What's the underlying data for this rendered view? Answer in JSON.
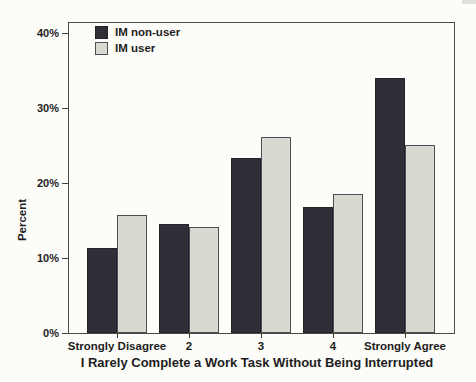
{
  "chart_data": {
    "type": "bar",
    "title": "",
    "categories": [
      "Strongly Disagree",
      "2",
      "3",
      "4",
      "Strongly Agree"
    ],
    "series": [
      {
        "name": "IM non-user",
        "color": "#2f2f38",
        "border_color": "#22222a",
        "values": [
          11.3,
          14.6,
          23.4,
          16.8,
          34.0
        ]
      },
      {
        "name": "IM user",
        "color": "#d9d9d1",
        "border_color": "#4d4d55",
        "values": [
          15.8,
          14.1,
          26.2,
          18.5,
          25.1
        ]
      }
    ],
    "xlabel": "I Rarely Complete a Work Task Without Being Interrupted",
    "ylabel": "Percent",
    "y_ticks": [
      {
        "label": "0%",
        "value": 0
      },
      {
        "label": "10%",
        "value": 10
      },
      {
        "label": "20%",
        "value": 20
      },
      {
        "label": "30%",
        "value": 30
      },
      {
        "label": "40%",
        "value": 40
      }
    ],
    "ylim": [
      0,
      41.5
    ],
    "grid": false,
    "legend_position": "top-left",
    "axis_color": "#4a4a4a",
    "paper_color": "#fcfcf9"
  }
}
